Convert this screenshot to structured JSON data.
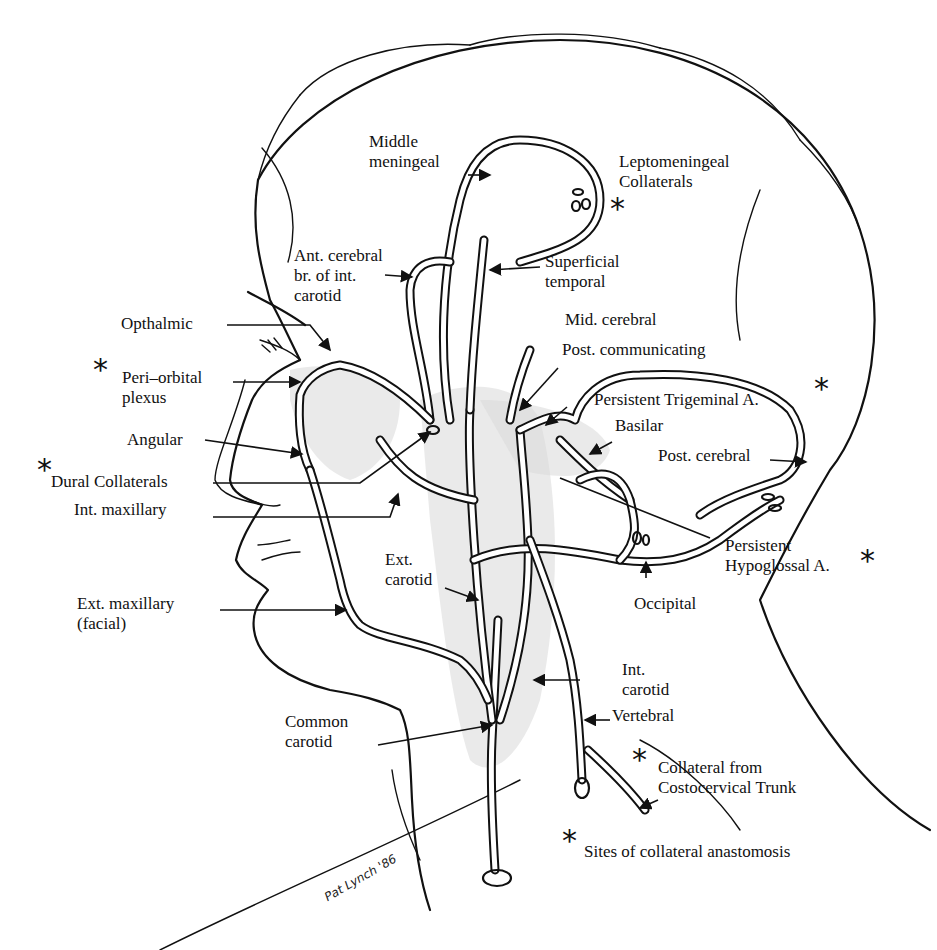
{
  "figure": {
    "type": "anatomical illustration",
    "signature": "Pat Lynch '86"
  },
  "labels": {
    "middle_meningeal": [
      "Middle",
      "meningeal"
    ],
    "leptomeningeal": [
      "Leptomeningeal",
      "Collaterals"
    ],
    "ant_cerebral": [
      "Ant. cerebral",
      "br. of int.",
      "carotid"
    ],
    "superficial_temporal": [
      "Superficial",
      "temporal"
    ],
    "opthalmic": "Opthalmic",
    "mid_cerebral": "Mid. cerebral",
    "post_communicating": "Post. communicating",
    "peri_orbital": [
      "Peri–orbital",
      "plexus"
    ],
    "persistent_trigeminal": "Persistent Trigeminal A.",
    "basilar": "Basilar",
    "angular": "Angular",
    "post_cerebral": "Post. cerebral",
    "dural_collaterals": "Dural Collaterals",
    "int_maxillary": "Int. maxillary",
    "persistent_hypoglossal": [
      "Persistent",
      "Hypoglossal A."
    ],
    "ext_carotid": [
      "Ext.",
      "carotid"
    ],
    "ext_maxillary": [
      "Ext. maxillary",
      "(facial)"
    ],
    "occipital": "Occipital",
    "int_carotid": [
      "Int.",
      "carotid"
    ],
    "vertebral": "Vertebral",
    "common_carotid": [
      "Common",
      "carotid"
    ],
    "collateral_costocervical": [
      "Collateral from",
      "Costocervical Trunk"
    ]
  },
  "legend": {
    "symbol": "*",
    "text": "Sites of collateral anastomosis"
  },
  "collateral_sites": [
    "Leptomeningeal Collaterals",
    "Peri–orbital plexus",
    "Persistent Trigeminal A.",
    "Dural Collaterals",
    "Persistent Hypoglossal A.",
    "Collateral from Costocervical Trunk"
  ]
}
